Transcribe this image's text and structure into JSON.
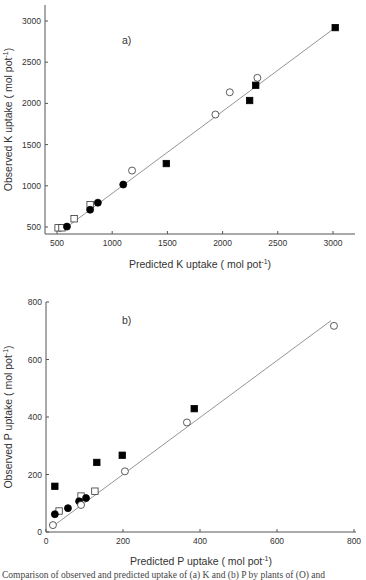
{
  "chart_data": [
    {
      "type": "scatter",
      "panel_label": "a)",
      "xlabel": "Predicted K uptake (  mol pot",
      "xlabel_sup": "-1",
      "ylabel": "Observed K uptake (  mol pot",
      "ylabel_sup": "-1",
      "xlim": [
        430,
        3200
      ],
      "ylim": [
        420,
        3230
      ],
      "xticks": [
        500,
        1000,
        1500,
        2000,
        2500,
        3000
      ],
      "yticks": [
        500,
        1000,
        1500,
        2000,
        2500,
        3000
      ],
      "grid": false,
      "fit_line": {
        "x": [
          590,
          3020
        ],
        "y": [
          500,
          2920
        ]
      },
      "series": [
        {
          "name": "open-square",
          "marker": "square",
          "filled": false,
          "points": [
            [
              510,
              490
            ],
            [
              545,
              490
            ],
            [
              655,
              600
            ],
            [
              800,
              770
            ]
          ]
        },
        {
          "name": "filled-circle",
          "marker": "circle",
          "filled": true,
          "points": [
            [
              590,
              505
            ],
            [
              800,
              710
            ],
            [
              870,
              795
            ],
            [
              1100,
              1015
            ]
          ]
        },
        {
          "name": "open-circle",
          "marker": "circle",
          "filled": false,
          "points": [
            [
              1180,
              1185
            ],
            [
              1935,
              1865
            ],
            [
              2065,
              2135
            ],
            [
              2315,
              2310
            ]
          ]
        },
        {
          "name": "filled-square",
          "marker": "square",
          "filled": true,
          "points": [
            [
              1490,
              1270
            ],
            [
              2245,
              2035
            ],
            [
              2300,
              2220
            ],
            [
              3020,
              2920
            ]
          ]
        }
      ]
    },
    {
      "type": "scatter",
      "panel_label": "b)",
      "xlabel": "Predicted P uptake (  mol pot",
      "xlabel_sup": "-1",
      "ylabel": "Observed P uptake (  mol pot",
      "ylabel_sup": "-1",
      "xlim": [
        0,
        800
      ],
      "ylim": [
        0,
        800
      ],
      "xticks": [
        0,
        200,
        400,
        600,
        800
      ],
      "yticks": [
        0,
        200,
        400,
        600,
        800
      ],
      "grid": false,
      "fit_line": {
        "x": [
          18,
          740
        ],
        "y": [
          20,
          735
        ]
      },
      "series": [
        {
          "name": "filled-square",
          "marker": "square",
          "filled": true,
          "points": [
            [
              23,
              159
            ],
            [
              132,
              242
            ],
            [
              198,
              267
            ],
            [
              385,
              429
            ]
          ]
        },
        {
          "name": "open-square",
          "marker": "square",
          "filled": false,
          "points": [
            [
              34,
              73
            ],
            [
              91,
              125
            ],
            [
              127,
              142
            ]
          ]
        },
        {
          "name": "filled-circle",
          "marker": "circle",
          "filled": true,
          "points": [
            [
              23,
              62
            ],
            [
              57,
              83
            ],
            [
              86,
              107
            ],
            [
              104,
              118
            ]
          ]
        },
        {
          "name": "open-circle",
          "marker": "circle",
          "filled": false,
          "points": [
            [
              18,
              24
            ],
            [
              91,
              94
            ],
            [
              205,
              211
            ],
            [
              366,
              381
            ],
            [
              748,
              717
            ]
          ]
        }
      ]
    }
  ],
  "caption": "Comparison of observed and predicted uptake of (a) K and (b) P by plants of (O) and"
}
